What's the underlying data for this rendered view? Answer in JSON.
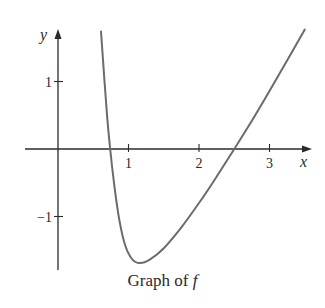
{
  "chart_data": {
    "type": "line",
    "title": "Graph of f",
    "caption_prefix": "Graph of ",
    "caption_var": "f",
    "xlabel": "x",
    "ylabel": "y",
    "xlim": [
      -0.45,
      3.6
    ],
    "ylim": [
      -1.8,
      1.75
    ],
    "xticks": [
      1,
      2,
      3
    ],
    "xtick_labels": [
      "1",
      "2",
      "3"
    ],
    "yticks": [
      1,
      -1
    ],
    "ytick_labels": [
      "1",
      "−1"
    ],
    "grid": false,
    "legend": null,
    "series": [
      {
        "name": "f",
        "x": [
          0.61,
          0.66,
          0.7,
          0.74,
          0.8,
          0.87,
          0.95,
          1.05,
          1.16,
          1.3,
          1.5,
          1.75,
          2.0,
          2.25,
          2.5,
          2.75,
          3.0,
          3.25,
          3.5
        ],
        "y": [
          1.74,
          1.0,
          0.45,
          0.0,
          -0.55,
          -1.05,
          -1.42,
          -1.63,
          -1.69,
          -1.64,
          -1.47,
          -1.16,
          -0.8,
          -0.41,
          0.0,
          0.42,
          0.86,
          1.31,
          1.77
        ]
      }
    ],
    "features": {
      "x_intercepts": [
        0.74,
        2.5
      ],
      "minimum": {
        "x": 1.16,
        "y": -1.69
      },
      "vertical_asymptote_like_rise_near_x": 0.6
    }
  }
}
